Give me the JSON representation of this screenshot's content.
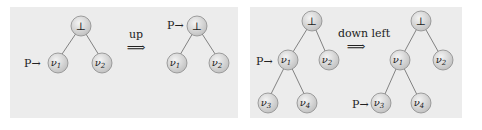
{
  "colors": {
    "panel_bg": "#ececec",
    "node_fill": "#d9d9d9",
    "node_stroke": "#8a8a8a",
    "edge": "#666666",
    "text": "#222222"
  },
  "panels": [
    {
      "name": "up-example",
      "before": {
        "root": "⊥",
        "children": [
          "ν1",
          "ν2"
        ],
        "pointer": "P→",
        "pointer_at": "ν1"
      },
      "operation": "up",
      "arrow": "⟹",
      "after": {
        "root": "⊥",
        "children": [
          "ν1",
          "ν2"
        ],
        "pointer": "P→",
        "pointer_at": "⊥"
      }
    },
    {
      "name": "down-left-example",
      "before": {
        "root": "⊥",
        "children": [
          "ν1",
          "ν2"
        ],
        "grandchildren": [
          "ν3",
          "ν4"
        ],
        "pointer": "P→",
        "pointer_at": "ν1"
      },
      "operation": "down left",
      "arrow": "⟹",
      "after": {
        "root": "⊥",
        "children": [
          "ν1",
          "ν2"
        ],
        "grandchildren": [
          "ν3",
          "ν4"
        ],
        "pointer": "P→",
        "pointer_at": "ν3"
      }
    }
  ],
  "labels": {
    "bottom": "⊥",
    "n1": "ν",
    "n1s": "1",
    "n2": "ν",
    "n2s": "2",
    "n3": "ν",
    "n3s": "3",
    "n4": "ν",
    "n4s": "4",
    "pointer": "P→",
    "op_up": "up",
    "op_down_left": "down left",
    "arrow": "⟹"
  }
}
